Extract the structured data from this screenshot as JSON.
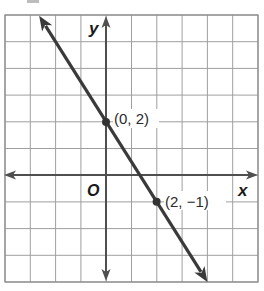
{
  "chart_data": {
    "type": "line",
    "title": "",
    "xlabel": "x",
    "ylabel": "y",
    "origin_label": "O",
    "xlim": [
      -4,
      6
    ],
    "ylim": [
      -4,
      6
    ],
    "grid": true,
    "grid_step": 1,
    "tick_labels_shown": false,
    "legend": null,
    "series": [
      {
        "name": "line",
        "equation": "y = -1.5x + 2",
        "slope": -1.5,
        "y_intercept": 2,
        "x": [
          -2.65,
          0,
          2,
          4
        ],
        "y": [
          5.975,
          2,
          -1,
          -4
        ],
        "arrows_both_ends": true,
        "color": "#3a3a3a"
      }
    ],
    "annotations": [
      {
        "x": 0,
        "y": 2,
        "text": "(0, 2)"
      },
      {
        "x": 2,
        "y": -1,
        "text": "(2, −1)"
      }
    ]
  },
  "labels": {
    "x_axis": "x",
    "y_axis": "y",
    "origin": "O",
    "point1": "(0, 2)",
    "point2": "(2, −1)"
  },
  "colors": {
    "grid": "#9f9f9f",
    "axis": "#4f4f4f",
    "line": "#3a3a3a",
    "background": "#ffffff"
  }
}
